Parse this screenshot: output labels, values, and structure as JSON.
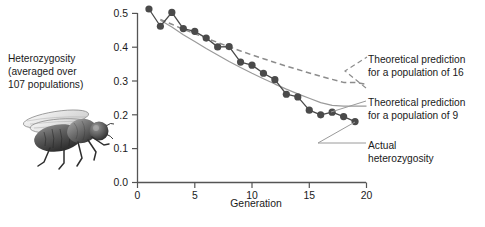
{
  "figure": {
    "left_caption": "Heterozygosity\n(averaged over\n107 populations)",
    "fly_icon_name": "drosophila-fly-illustration"
  },
  "legend": {
    "theoretical_16": "Theoretical prediction\nfor a population of 16",
    "theoretical_9": "Theoretical prediction\nfor a population of 9",
    "actual": "Actual\nheterozygosity"
  },
  "axes": {
    "x_title": "Generation",
    "x_ticks": [
      "0",
      "5",
      "10",
      "15",
      "20"
    ],
    "y_ticks": [
      "0.0",
      "0.1",
      "0.2",
      "0.3",
      "0.4",
      "0.5"
    ]
  },
  "colors": {
    "marker": "#4a4a4a",
    "actual_line": "#555555",
    "theory16": "#8c8c8c",
    "theory9": "#9a9a9a",
    "axis": "#555555",
    "text": "#1a1a1a",
    "background": "#ffffff"
  },
  "chart_data": {
    "type": "line",
    "title": "",
    "xlabel": "Generation",
    "ylabel": "Heterozygosity (averaged over 107 populations)",
    "xlim": [
      0,
      20
    ],
    "ylim": [
      0.0,
      0.5
    ],
    "xticks": [
      0,
      5,
      10,
      15,
      20
    ],
    "yticks": [
      0.0,
      0.1,
      0.2,
      0.3,
      0.4,
      0.5
    ],
    "grid": false,
    "legend_position": "right-outside",
    "series": [
      {
        "name": "Actual heterozygosity",
        "style": "solid-with-markers",
        "color": "#4a4a4a",
        "x": [
          1,
          2,
          3,
          4,
          5,
          6,
          7,
          8,
          9,
          10,
          11,
          12,
          13,
          14,
          15,
          16,
          17,
          18,
          19
        ],
        "values": [
          0.513,
          0.462,
          0.503,
          0.455,
          0.447,
          0.427,
          0.401,
          0.402,
          0.356,
          0.347,
          0.323,
          0.304,
          0.261,
          0.253,
          0.214,
          0.2,
          0.208,
          0.195,
          0.18
        ]
      },
      {
        "name": "Theoretical prediction for a population of 16",
        "style": "dashed",
        "color": "#8c8c8c",
        "x": [
          2,
          3,
          4,
          5,
          6,
          7,
          8,
          9,
          10,
          11,
          12,
          13,
          14,
          15,
          16,
          17,
          18,
          19,
          20
        ],
        "values": [
          0.482,
          0.468,
          0.453,
          0.44,
          0.427,
          0.414,
          0.401,
          0.389,
          0.377,
          0.366,
          0.355,
          0.344,
          0.334,
          0.324,
          0.314,
          0.305,
          0.296,
          0.296,
          0.29
        ]
      },
      {
        "name": "Theoretical prediction for a population of 9",
        "style": "solid-thin",
        "color": "#9a9a9a",
        "x": [
          2,
          3,
          4,
          5,
          6,
          7,
          8,
          9,
          10,
          11,
          12,
          13,
          14,
          15,
          16,
          17,
          18,
          19,
          20
        ],
        "values": [
          0.48,
          0.46,
          0.437,
          0.417,
          0.396,
          0.377,
          0.358,
          0.34,
          0.323,
          0.307,
          0.291,
          0.276,
          0.262,
          0.249,
          0.236,
          0.228,
          0.226,
          0.226,
          0.226
        ]
      }
    ]
  }
}
